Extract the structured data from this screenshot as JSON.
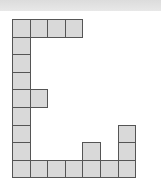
{
  "diagram": {
    "type": "polyomino-grid",
    "grid": {
      "origin_x": 12,
      "origin_y": 19,
      "cell_size": 17.6,
      "columns": 7,
      "rows": 9
    },
    "colors": {
      "cell_fill": "#d9d9d9",
      "cell_border": "#555555",
      "top_band": "#e0e0e0",
      "background": "#ffffff"
    },
    "filled_cells": [
      [
        0,
        0
      ],
      [
        1,
        0
      ],
      [
        2,
        0
      ],
      [
        3,
        0
      ],
      [
        0,
        1
      ],
      [
        0,
        2
      ],
      [
        0,
        3
      ],
      [
        0,
        4
      ],
      [
        1,
        4
      ],
      [
        0,
        5
      ],
      [
        0,
        6
      ],
      [
        6,
        6
      ],
      [
        0,
        7
      ],
      [
        4,
        7
      ],
      [
        6,
        7
      ],
      [
        0,
        8
      ],
      [
        1,
        8
      ],
      [
        2,
        8
      ],
      [
        3,
        8
      ],
      [
        4,
        8
      ],
      [
        5,
        8
      ],
      [
        6,
        8
      ]
    ],
    "cell_count": 22
  }
}
